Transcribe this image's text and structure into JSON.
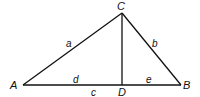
{
  "diagram": {
    "vertices": {
      "A": {
        "label": "A",
        "x": 23,
        "y": 85
      },
      "B": {
        "label": "B",
        "x": 181,
        "y": 85
      },
      "C": {
        "label": "C",
        "x": 122,
        "y": 13
      },
      "D": {
        "label": "D",
        "x": 122,
        "y": 85
      }
    },
    "segments": {
      "a": {
        "label": "a",
        "from": "A",
        "to": "C"
      },
      "b": {
        "label": "b",
        "from": "C",
        "to": "B"
      },
      "c": {
        "label": "c",
        "from": "A",
        "to": "B"
      },
      "d": {
        "label": "d",
        "from": "A",
        "to": "D"
      },
      "e": {
        "label": "e",
        "from": "D",
        "to": "B"
      },
      "altitude": {
        "from": "C",
        "to": "D"
      }
    },
    "line_color": "#111111"
  }
}
